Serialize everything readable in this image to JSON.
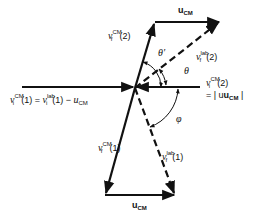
{
  "diagram": {
    "labels": {
      "u_cm_top": {
        "base": "u",
        "sub": "CM"
      },
      "u_cm_bottom": {
        "base": "u",
        "sub": "CM"
      },
      "vf_cm_2": {
        "base": "v",
        "sub": "f",
        "sup": "CM",
        "arg": "(2)"
      },
      "vf_lab_2": {
        "base": "v",
        "sub": "f",
        "sup": "lab",
        "arg": "(2)"
      },
      "vi_cm_2": {
        "base": "v",
        "sub": "i",
        "sup": "CM",
        "arg": "(2)"
      },
      "vi_cm_2_eq": "= | u",
      "vi_cm_2_eq_sub": "CM",
      "vi_cm_2_eq_end": " |",
      "vi_cm_1_lhs": {
        "base": "v",
        "sub": "i",
        "sup": "CM",
        "arg": "(1) ="
      },
      "vi_cm_1_mid": {
        "base": "v",
        "sub": "i",
        "sup": "lab",
        "arg": "(1) −"
      },
      "vi_cm_1_rhs": {
        "base": "u",
        "sub": "CM"
      },
      "vf_cm_1": {
        "base": "v",
        "sub": "f",
        "sup": "CM",
        "arg": "(1)"
      },
      "vf_lab_1": {
        "base": "v",
        "sub": "f",
        "sup": "lab",
        "arg": "(1)"
      },
      "theta_prime": "θ′",
      "theta": "θ",
      "phi": "φ"
    },
    "vectors": [
      {
        "name": "vi_cm_1",
        "from": [
          22,
          87
        ],
        "to": [
          133,
          87
        ],
        "style": "solid"
      },
      {
        "name": "vi_cm_2",
        "from": [
          200,
          87
        ],
        "to": [
          137,
          87
        ],
        "style": "solid"
      },
      {
        "name": "vf_cm_2",
        "from": [
          135,
          87
        ],
        "to": [
          155,
          22
        ],
        "style": "solid"
      },
      {
        "name": "u_cm_top",
        "from": [
          155,
          22
        ],
        "to": [
          220,
          22
        ],
        "style": "solid"
      },
      {
        "name": "vf_lab_2",
        "from": [
          135,
          87
        ],
        "to": [
          220,
          22
        ],
        "style": "dashed"
      },
      {
        "name": "vf_cm_1",
        "from": [
          135,
          87
        ],
        "to": [
          105,
          195
        ],
        "style": "solid"
      },
      {
        "name": "u_cm_bottom",
        "from": [
          105,
          195
        ],
        "to": [
          175,
          195
        ],
        "style": "solid"
      },
      {
        "name": "vf_lab_1",
        "from": [
          135,
          87
        ],
        "to": [
          175,
          195
        ],
        "style": "dashed"
      }
    ],
    "colors": {
      "ink": "#111111",
      "background": "#ffffff"
    }
  }
}
